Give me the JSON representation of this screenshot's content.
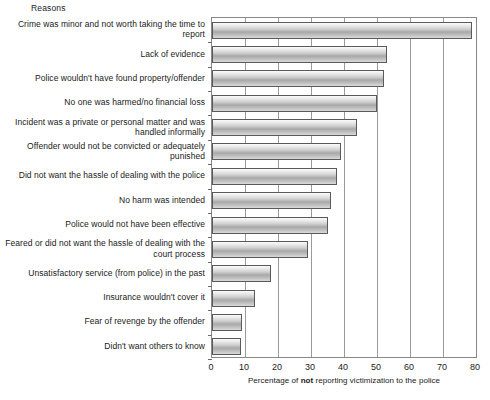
{
  "header": {
    "reasons_label": "Reasons"
  },
  "chart_data": {
    "type": "bar",
    "orientation": "horizontal",
    "title": "",
    "xlabel_prefix": "Percentage of ",
    "xlabel_emphasis": "not",
    "xlabel_suffix": " reporting victimization to the police",
    "xlabel": "Percentage of not reporting victimization to the police",
    "ylabel": "Reasons",
    "xlim": [
      0,
      80
    ],
    "xticks": [
      0,
      10,
      20,
      30,
      40,
      50,
      60,
      70,
      80
    ],
    "xtick_labels": [
      "0",
      "10",
      "20",
      "30",
      "40",
      "50",
      "60",
      "70",
      "80"
    ],
    "grid": "vertical",
    "legend": "none",
    "categories": [
      "Crime was minor and not worth taking the time to report",
      "Lack of evidence",
      "Police wouldn't have found property/offender",
      "No one was harmed/no financial loss",
      "Incident was a private or personal matter and was handled informally",
      "Offender would not be convicted or adequately punished",
      "Did not want the hassle of dealing with the police",
      "No harm was intended",
      "Police would not have been effective",
      "Feared or did not want the hassle of dealing with the court process",
      "Unsatisfactory service (from police) in the past",
      "Insurance wouldn't cover it",
      "Fear of revenge by the offender",
      "Didn't want others to know"
    ],
    "values": [
      78.8,
      53.0,
      52.0,
      50.0,
      44.0,
      39.0,
      38.0,
      36.0,
      35.0,
      29.0,
      18.0,
      13.0,
      9.0,
      8.7
    ]
  },
  "colors": {
    "bar_edge": "#5a5a5a",
    "bar_fill_light": "#f2f2f2",
    "bar_fill_dark": "#a8a8a8",
    "axis": "#888888",
    "grid": "#9a9a9a",
    "text": "#1a1a1a"
  }
}
